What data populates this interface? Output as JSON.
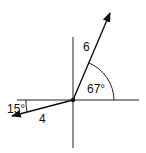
{
  "diagram": {
    "type": "vector-diagram",
    "origin": {
      "x": 73,
      "y": 100
    },
    "axes": {
      "horizontal": true,
      "vertical": true
    },
    "vectors": [
      {
        "label": "6",
        "magnitude": 6,
        "angle_label": "67°",
        "angle_deg": 67,
        "reference": "positive x-axis",
        "quadrant": "I"
      },
      {
        "label": "4",
        "magnitude": 4,
        "angle_label": "15°",
        "angle_deg": 15,
        "reference": "negative x-axis, below",
        "quadrant": "III"
      }
    ],
    "labels": {
      "vector_a": "6",
      "vector_b": "4",
      "angle_a": "67°",
      "angle_b": "15°"
    },
    "colors": {
      "line": "#111111",
      "background": "#ffffff"
    }
  }
}
